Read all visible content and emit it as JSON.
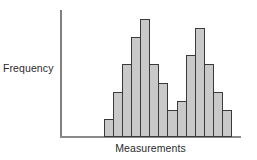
{
  "figure": {
    "width": 257,
    "height": 160,
    "background": "#ffffff"
  },
  "axes": {
    "y_axis_name": "y-axis",
    "x_axis_name": "x-axis",
    "axis_color": "#808080",
    "ylabel": "Frequency",
    "xlabel": "Measurements"
  },
  "style": {
    "bar_fill": "#c9c9c9",
    "bar_border": "#3a3a3a",
    "text_color": "#2b2b2b"
  },
  "chart_data": {
    "type": "bar",
    "title": "",
    "xlabel": "Measurements",
    "ylabel": "Frequency",
    "subtitle": "",
    "grid": false,
    "legend": null,
    "annotations": [],
    "xlim": [
      0,
      14
    ],
    "ylim": [
      0,
      14
    ],
    "categories": [
      "1",
      "2",
      "3",
      "4",
      "5",
      "6",
      "7",
      "8",
      "9",
      "10",
      "11",
      "12",
      "13",
      "14"
    ],
    "values": [
      2,
      5,
      8,
      11,
      13,
      8,
      6,
      3,
      4,
      9,
      12,
      8,
      5,
      3
    ]
  }
}
